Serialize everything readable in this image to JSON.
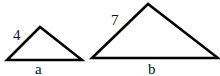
{
  "diagram": {
    "triangles": [
      {
        "name": "small",
        "side_label": "4",
        "base_label": "a",
        "points": [
          [
            7,
            60
          ],
          [
            40,
            27
          ],
          [
            82,
            60
          ]
        ]
      },
      {
        "name": "large",
        "side_label": "7",
        "base_label": "b",
        "points": [
          [
            92,
            58
          ],
          [
            148,
            4
          ],
          [
            218,
            58
          ]
        ]
      }
    ],
    "stroke_color": "#000000"
  }
}
